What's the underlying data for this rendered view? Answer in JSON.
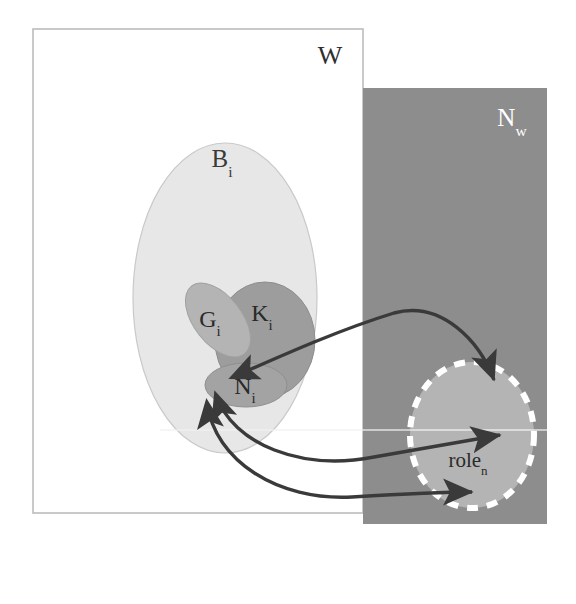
{
  "figure": {
    "type": "set-containment-venn-diagram",
    "background_color": "#ffffff"
  },
  "regions": [
    {
      "id": "world-rect",
      "shape": "rectangle",
      "label": "W",
      "label_sub": "",
      "fill": "#ffffff",
      "stroke": "#b9b9b9",
      "text_color": "#2e2e2e",
      "x": 33,
      "y": 29,
      "w": 330,
      "h": 484,
      "label_x": 330,
      "label_y": 64
    },
    {
      "id": "nw-rect",
      "shape": "rectangle",
      "label": "N",
      "label_sub": "w",
      "fill": "#8d8d8d",
      "stroke": "none",
      "text_color": "#ffffff",
      "x": 363,
      "y": 88,
      "w": 184,
      "h": 436,
      "label_x": 516,
      "label_y": 126
    },
    {
      "id": "bi-ellipse",
      "shape": "ellipse",
      "label": "B",
      "label_sub": "i",
      "fill": "#e7e7e7",
      "stroke": "#c5c5c5",
      "text_color": "#3a3a3a",
      "cx": 225,
      "cy": 298,
      "rx": 92,
      "ry": 155,
      "label_x": 226,
      "label_y": 166
    },
    {
      "id": "ki-ellipse",
      "shape": "ellipse",
      "label": "K",
      "label_sub": "i",
      "fill": "#9d9d9d",
      "stroke": "#8c8c8c",
      "text_color": "#2a2a2a",
      "cx": 265,
      "cy": 340,
      "rx": 50,
      "ry": 58,
      "label_x": 267,
      "label_y": 321
    },
    {
      "id": "gi-ellipse",
      "shape": "ellipse",
      "label": "G",
      "label_sub": "i",
      "fill": "#b3b3b3",
      "stroke": "#9e9e9e",
      "text_color": "#2a2a2a",
      "cx": 218,
      "cy": 320,
      "rx": 24,
      "ry": 43,
      "rotation": -38,
      "label_x": 213,
      "label_y": 327
    },
    {
      "id": "ni-ellipse",
      "shape": "ellipse",
      "label": "N",
      "label_sub": "i",
      "fill": "#a2a2a2",
      "stroke": "#8f8f8f",
      "text_color": "#2a2a2a",
      "cx": 246,
      "cy": 385,
      "rx": 41,
      "ry": 22,
      "label_x": 247,
      "label_y": 393
    },
    {
      "id": "rolen-ellipse",
      "shape": "ellipse-dashed",
      "label": "role",
      "label_sub": "n",
      "fill": "#b4b4b4",
      "stroke": "#ffffff",
      "text_color": "#2a2a2a",
      "cx": 472,
      "cy": 435,
      "rx": 62,
      "ry": 73,
      "label_x": 474,
      "label_y": 466
    }
  ],
  "arrows": [
    {
      "id": "arrow-top",
      "from": "nw-rect-upper",
      "to": "ni-ellipse",
      "color": "#3a3a3a",
      "double_headed": true,
      "path": "M 232 378 C 290 352, 340 330, 392 313 C 440 300, 478 340, 492 378"
    },
    {
      "id": "arrow-middle",
      "from": "ni-ellipse",
      "to": "rolen-ellipse",
      "color": "#3a3a3a",
      "double_headed": true,
      "path": "M 215 396 C 232 444, 300 470, 372 457 C 420 450, 462 441, 498 435"
    },
    {
      "id": "arrow-bottom",
      "from": "ni-ellipse",
      "to": "rolen-ellipse-lower",
      "color": "#3a3a3a",
      "double_headed": true,
      "path": "M 206 404 C 214 460, 276 500, 350 497 C 400 494, 440 492, 470 492"
    }
  ],
  "labels": {
    "w": "W",
    "nw": "N",
    "nw_sub": "w",
    "bi": "B",
    "bi_sub": "i",
    "ki": "K",
    "ki_sub": "i",
    "gi": "G",
    "gi_sub": "i",
    "ni": "N",
    "ni_sub": "i",
    "rolen": "role",
    "rolen_sub": "n"
  }
}
